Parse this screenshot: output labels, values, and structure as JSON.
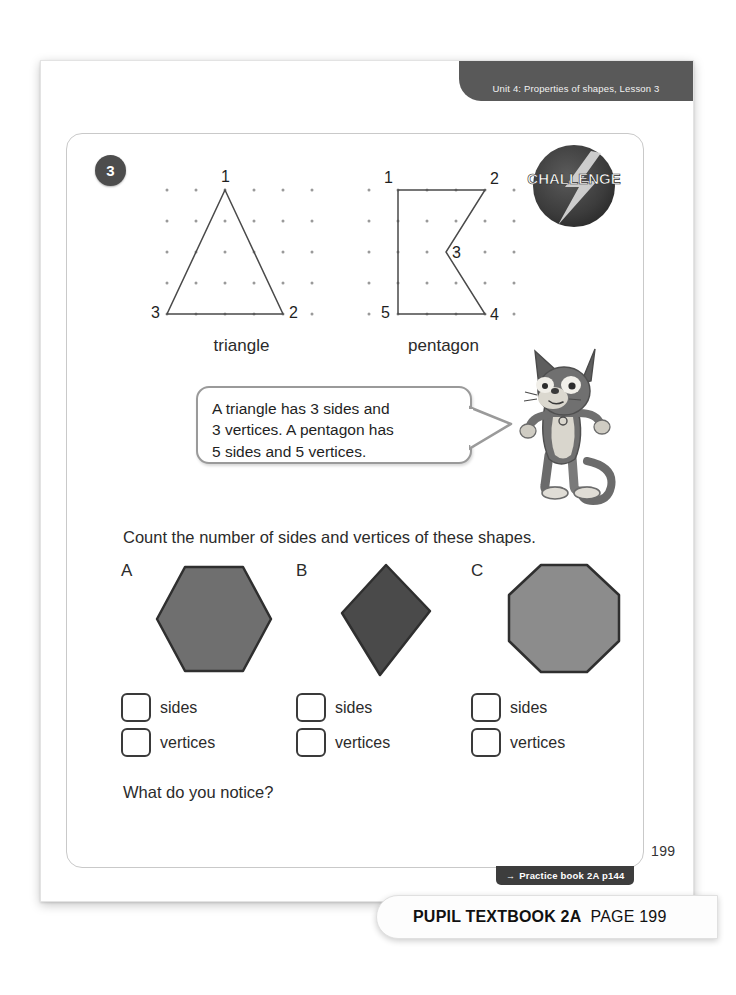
{
  "header": {
    "unit_label": "Unit 4: Properties of shapes, Lesson 3"
  },
  "question": {
    "number": "3",
    "challenge_badge_label": "CHALLENGE"
  },
  "figures": [
    {
      "name": "triangle",
      "caption": "triangle",
      "vertex_labels": [
        "1",
        "2",
        "3"
      ],
      "grid": {
        "cols": 6,
        "rows": 5,
        "spacing_x": 29,
        "spacing_y": 31
      }
    },
    {
      "name": "pentagon",
      "caption": "pentagon",
      "vertex_labels": [
        "1",
        "2",
        "3",
        "4",
        "5"
      ],
      "grid": {
        "cols": 6,
        "rows": 5,
        "spacing_x": 29,
        "spacing_y": 31
      }
    }
  ],
  "speech_bubble": {
    "line1": "A triangle has 3 sides and",
    "line2": "3 vertices. A pentagon has",
    "line3": "5 sides and 5 vertices."
  },
  "instruction": "Count the number of sides and vertices of these shapes.",
  "shapes": [
    {
      "letter": "A",
      "type": "hexagon",
      "fill": "#6f6f6f",
      "stroke": "#2f2f2f"
    },
    {
      "letter": "B",
      "type": "kite",
      "fill": "#4a4a4a",
      "stroke": "#2f2f2f"
    },
    {
      "letter": "C",
      "type": "octagon",
      "fill": "#8c8c8c",
      "stroke": "#2f2f2f"
    }
  ],
  "answers": [
    {
      "letter": "A",
      "sides_label": "sides",
      "vertices_label": "vertices",
      "sides_value": "",
      "vertices_value": ""
    },
    {
      "letter": "B",
      "sides_label": "sides",
      "vertices_label": "vertices",
      "sides_value": "",
      "vertices_value": ""
    },
    {
      "letter": "C",
      "sides_label": "sides",
      "vertices_label": "vertices",
      "sides_value": "",
      "vertices_value": ""
    }
  ],
  "notice_prompt": "What do you notice?",
  "practice_tab": {
    "arrow": "→",
    "label": "Practice book 2A p144"
  },
  "page_number": "199",
  "caption": {
    "book": "PUPIL TEXTBOOK 2A",
    "page": "PAGE 199"
  },
  "colors": {
    "header_bar": "#595959",
    "badge_dark": "#4d4d4d",
    "panel_border": "#c9c9c9",
    "text": "#2b2b2b"
  }
}
